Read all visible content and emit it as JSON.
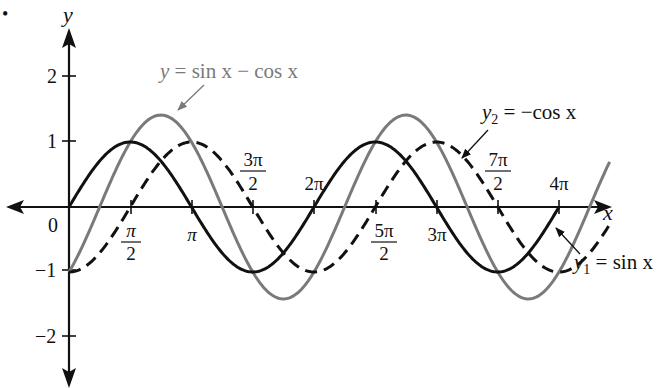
{
  "chart_data": {
    "type": "line",
    "title": "",
    "xlabel": "x",
    "ylabel": "y",
    "origin_label": "0",
    "xlim": [
      0,
      12.566
    ],
    "ylim": [
      -2.8,
      2.8
    ],
    "grid": false,
    "legend": "inline annotations with arrows",
    "x_ticks": [
      {
        "value": 1.5708,
        "label_num": "π",
        "label_den": "2",
        "position": "below"
      },
      {
        "value": 3.1416,
        "label": "π",
        "position": "below"
      },
      {
        "value": 4.7124,
        "label_num": "3π",
        "label_den": "2",
        "position": "above"
      },
      {
        "value": 6.2832,
        "label": "2π",
        "position": "above"
      },
      {
        "value": 7.854,
        "label_num": "5π",
        "label_den": "2",
        "position": "below"
      },
      {
        "value": 9.4248,
        "label": "3π",
        "position": "below"
      },
      {
        "value": 10.9956,
        "label_num": "7π",
        "label_den": "2",
        "position": "above"
      },
      {
        "value": 12.5664,
        "label": "4π",
        "position": "above"
      }
    ],
    "y_ticks": [
      {
        "value": 2,
        "label": "2"
      },
      {
        "value": 1,
        "label": "1"
      },
      {
        "value": -1,
        "label": "−1"
      },
      {
        "value": -2,
        "label": "−2"
      }
    ],
    "series": [
      {
        "name": "y1 = sin x",
        "function": "sin(x)",
        "style": "solid",
        "color": "#111111",
        "x": [
          0,
          1.5708,
          3.1416,
          4.7124,
          6.2832,
          7.854,
          9.4248,
          10.9956,
          12.5664
        ],
        "values": [
          0,
          1,
          0,
          -1,
          0,
          1,
          0,
          -1,
          0
        ]
      },
      {
        "name": "y2 = −cos x",
        "function": "-cos(x)",
        "style": "dashed",
        "color": "#111111",
        "x": [
          0,
          1.5708,
          3.1416,
          4.7124,
          6.2832,
          7.854,
          9.4248,
          10.9956,
          12.5664
        ],
        "values": [
          -1,
          0,
          1,
          0,
          -1,
          0,
          1,
          0,
          -1
        ]
      },
      {
        "name": "y = sin x − cos x",
        "function": "sin(x)-cos(x)",
        "style": "solid",
        "color": "#7a7a7a",
        "x": [
          0,
          0.7854,
          2.3562,
          3.927,
          5.4978,
          7.0686,
          8.6394,
          10.2102,
          11.781,
          12.5664
        ],
        "values": [
          -1,
          0,
          1.414,
          0,
          -1.414,
          0,
          1.414,
          0,
          -1.414,
          -1
        ]
      }
    ],
    "annotations": [
      {
        "label": "y = sin x − cos x",
        "target_series": "y = sin x − cos x"
      },
      {
        "label_var": "y",
        "label_sub": "2",
        "label_rest": " = −cos x",
        "target_series": "y2 = −cos x"
      },
      {
        "label_var": "y",
        "label_sub": "1",
        "label_rest": " = sin x",
        "target_series": "y1 = sin x"
      }
    ]
  },
  "labels": {
    "y_axis": "y",
    "x_axis": "x",
    "origin": "0",
    "bullet": "•",
    "tick_pi_over_2_num": "π",
    "tick_pi_over_2_den": "2",
    "tick_pi": "π",
    "tick_3pi_over_2_num": "3π",
    "tick_3pi_over_2_den": "2",
    "tick_2pi": "2π",
    "tick_5pi_over_2_num": "5π",
    "tick_5pi_over_2_den": "2",
    "tick_3pi": "3π",
    "tick_7pi_over_2_num": "7π",
    "tick_7pi_over_2_den": "2",
    "tick_4pi": "4π",
    "ytick_2": "2",
    "ytick_1": "1",
    "ytick_m1": "−1",
    "ytick_m2": "−2",
    "ann_sum_y": "y",
    "ann_sum_rest": " = sin x − cos x",
    "ann_y2_var": "y",
    "ann_y2_sub": "2",
    "ann_y2_rest": " = −cos x",
    "ann_y1_var": "y",
    "ann_y1_sub": "1",
    "ann_y1_rest": " = sin x"
  }
}
